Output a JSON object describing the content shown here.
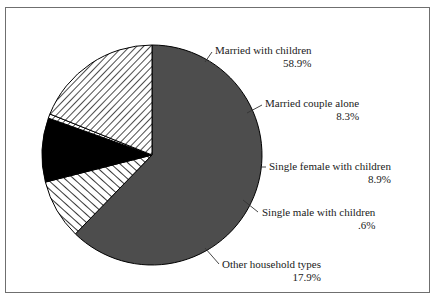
{
  "figure": {
    "border_color": "#6f6f6f",
    "background": "#ffffff"
  },
  "chart_data": {
    "type": "pie",
    "title": "",
    "subtitle": "",
    "xlabel": "",
    "ylabel": "",
    "legend_position": "callout-labels",
    "grid": false,
    "start_angle_deg": 0,
    "direction": "clockwise",
    "center": {
      "x": 152,
      "y": 155
    },
    "radius": 110,
    "categories": [
      "Married with children",
      "Married couple alone",
      "Single female with children",
      "Single male with children",
      "Other household types"
    ],
    "values": [
      58.9,
      8.3,
      8.9,
      0.6,
      17.9
    ],
    "value_labels": [
      "58.9%",
      "8.3%",
      "8.9%",
      ".6%",
      "17.9%"
    ],
    "slices": [
      {
        "label": "Married with children",
        "percent_label": "58.9%",
        "value": 58.9,
        "fill": "solid-gray",
        "color": "#4d4d4d",
        "label_x": 215,
        "label_y": 44,
        "leader_from_x": 205,
        "leader_from_y": 62,
        "leader_to_x": 212,
        "leader_to_y": 52
      },
      {
        "label": "Married couple alone",
        "percent_label": "8.3%",
        "value": 8.3,
        "fill": "hatch-forward",
        "color": "#ffffff",
        "label_x": 265,
        "label_y": 97,
        "leader_from_x": 247,
        "leader_from_y": 113,
        "leader_to_x": 262,
        "leader_to_y": 105
      },
      {
        "label": "Single female with children",
        "percent_label": "8.9%",
        "value": 8.9,
        "fill": "solid-black",
        "color": "#000000",
        "label_x": 269,
        "label_y": 160,
        "leader_from_x": 260,
        "leader_from_y": 167,
        "leader_to_x": 266,
        "leader_to_y": 167
      },
      {
        "label": "Single male with children",
        "percent_label": ".6%",
        "value": 0.6,
        "fill": "hatch-back",
        "color": "#ffffff",
        "label_x": 262,
        "label_y": 206,
        "leader_from_x": 243,
        "leader_from_y": 200,
        "leader_to_x": 258,
        "leader_to_y": 212
      },
      {
        "label": "Other household types",
        "percent_label": "17.9%",
        "value": 17.9,
        "fill": "hatch-back",
        "color": "#ffffff",
        "label_x": 222,
        "label_y": 258,
        "leader_from_x": 205,
        "leader_from_y": 248,
        "leader_to_x": 219,
        "leader_to_y": 264
      }
    ]
  }
}
